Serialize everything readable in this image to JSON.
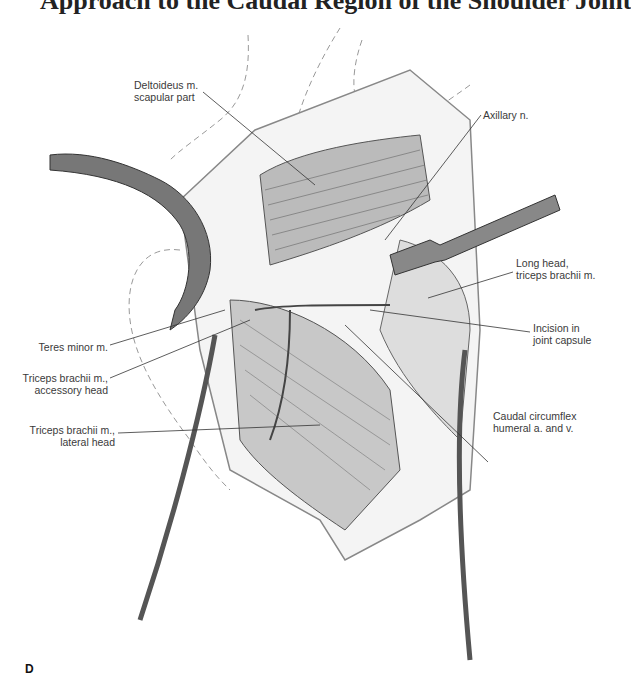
{
  "page": {
    "heading_fragment": "Approach to the Caudal Region of the Shoulder Joint",
    "panel_letter": "D"
  },
  "figure": {
    "labels": [
      {
        "id": "deltoideus",
        "lines": [
          "Deltoideus m.",
          "scapular part"
        ]
      },
      {
        "id": "axillary",
        "lines": [
          "Axillary n."
        ]
      },
      {
        "id": "long-head",
        "lines": [
          "Long head,",
          "triceps brachii m."
        ]
      },
      {
        "id": "incision",
        "lines": [
          "Incision in",
          "joint capsule"
        ]
      },
      {
        "id": "caudal-circumflex",
        "lines": [
          "Caudal circumflex",
          "humeral a. and v."
        ]
      },
      {
        "id": "teres-minor",
        "lines": [
          "Teres minor m."
        ]
      },
      {
        "id": "triceps-accessory",
        "lines": [
          "Triceps brachii m.,",
          "accessory head"
        ]
      },
      {
        "id": "triceps-lateral",
        "lines": [
          "Triceps brachii m.,",
          "lateral head"
        ]
      }
    ]
  }
}
